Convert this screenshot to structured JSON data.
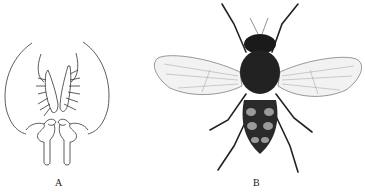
{
  "figure": {
    "panels": [
      {
        "id": "A",
        "label": "A",
        "description": "Line drawing of genitalia structure"
      },
      {
        "id": "B",
        "label": "B",
        "description": "Dorsal view of fly"
      }
    ]
  },
  "colors": {
    "line": "#333333",
    "body": "#1a1a1a",
    "wing": "#f4f4f4",
    "background": "#ffffff"
  }
}
